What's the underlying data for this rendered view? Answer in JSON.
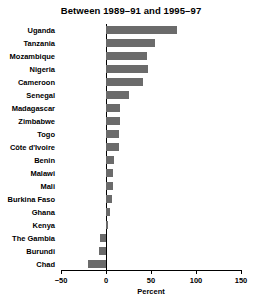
{
  "chart_data": {
    "type": "bar",
    "orientation": "horizontal",
    "title": "Between 1989–91 and 1995–97",
    "xlabel": "Percent",
    "ylabel": "",
    "xlim": [
      -50,
      150
    ],
    "xticks": [
      -50,
      0,
      50,
      100,
      150
    ],
    "xticklabels": [
      "−50",
      "0",
      "50",
      "100",
      "150"
    ],
    "grid": false,
    "legend": null,
    "bar_color": "#6b6b6b",
    "categories": [
      "Uganda",
      "Tanzania",
      "Mozambique",
      "Nigeria",
      "Cameroon",
      "Senegal",
      "Madagascar",
      "Zimbabwe",
      "Togo",
      "Côte d'Ivoire",
      "Benin",
      "Malawi",
      "Mali",
      "Burkina Faso",
      "Ghana",
      "Kenya",
      "The Gambia",
      "Burundi",
      "Chad"
    ],
    "values": [
      79,
      54,
      45,
      47,
      41,
      25,
      16,
      15,
      14,
      14,
      9,
      8,
      8,
      7,
      4,
      2,
      -7,
      -8,
      -20
    ]
  }
}
